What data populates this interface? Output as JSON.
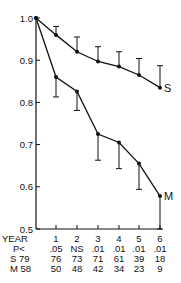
{
  "chart_data": {
    "type": "line",
    "title": "",
    "xlabel": "YEAR",
    "ylabel": "",
    "ylim": [
      0.5,
      1.0
    ],
    "yticks": [
      "1.0",
      "0.9",
      "0.8",
      "0.7",
      "0.6",
      "0.5"
    ],
    "x": [
      0,
      1,
      2,
      3,
      4,
      5,
      6
    ],
    "xticks": [
      "1",
      "2",
      "3",
      "4",
      "5",
      "6"
    ],
    "series": [
      {
        "name": "S",
        "values": [
          1.0,
          0.96,
          0.92,
          0.897,
          0.885,
          0.865,
          0.835
        ],
        "error_upper": [
          0,
          0.98,
          0.955,
          0.932,
          0.92,
          0.904,
          0.887
        ]
      },
      {
        "name": "M",
        "values": [
          1.0,
          0.86,
          0.826,
          0.725,
          0.705,
          0.655,
          0.578
        ],
        "error_lower": [
          0,
          0.813,
          0.781,
          0.663,
          0.643,
          0.594,
          0.5
        ]
      }
    ],
    "table": {
      "header_label": "YEAR",
      "years": [
        "1",
        "2",
        "3",
        "4",
        "5",
        "6"
      ],
      "rows": [
        {
          "label": "P<",
          "values": [
            ".05",
            "NS",
            ".01",
            ".01",
            ".01",
            ".01"
          ]
        },
        {
          "label": "S 79",
          "values": [
            "76",
            "73",
            "71",
            "61",
            "39",
            "18"
          ]
        },
        {
          "label": "M 58",
          "values": [
            "50",
            "48",
            "42",
            "34",
            "23",
            "9"
          ]
        }
      ]
    },
    "grid": false,
    "legend": "inline labels S and M at line ends"
  }
}
